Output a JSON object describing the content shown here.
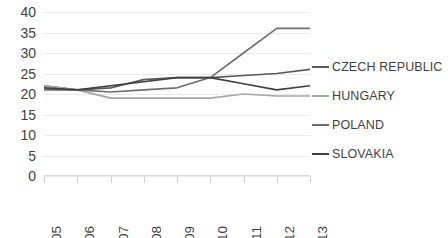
{
  "chart_data": {
    "type": "line",
    "title": "",
    "subtitle": "",
    "xlabel": "",
    "ylabel": "",
    "categories": [
      "2005",
      "2006",
      "2007",
      "2008",
      "2009",
      "2010",
      "2011",
      "2012",
      "2013"
    ],
    "ylim": [
      0,
      40
    ],
    "ytick_step": 5,
    "yticks": [
      "40",
      "35",
      "30",
      "25",
      "20",
      "15",
      "10",
      "5",
      "0"
    ],
    "grid": true,
    "legend_position": "right",
    "series": [
      {
        "name": "CZECH REPUBLIC",
        "color": "#595959",
        "values": [
          22,
          21,
          21.5,
          23.5,
          24,
          24,
          24.5,
          25,
          26
        ]
      },
      {
        "name": "HUNGARY",
        "color": "#a6a6a6",
        "values": [
          22,
          21,
          19,
          19,
          19,
          19,
          20,
          19.5,
          19.5
        ]
      },
      {
        "name": "POLAND",
        "color": "#6e6e6e",
        "values": [
          21,
          21,
          20.5,
          21,
          21.5,
          24,
          30,
          36,
          36
        ]
      },
      {
        "name": "SLOVAKIA",
        "color": "#404040",
        "values": [
          21.5,
          21,
          22,
          23,
          24,
          24,
          22.5,
          21,
          22
        ]
      }
    ]
  },
  "caption": {
    "text": ""
  }
}
